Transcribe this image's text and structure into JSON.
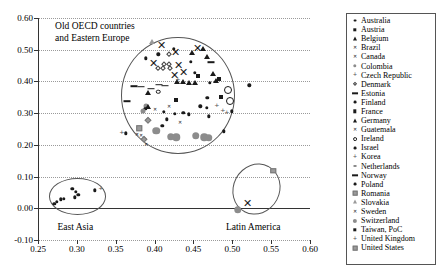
{
  "chart_data": {
    "type": "scatter",
    "title": "",
    "xlabel": "",
    "ylabel": "",
    "xlim": [
      0.25,
      0.6
    ],
    "ylim": [
      -0.1,
      0.6
    ],
    "grid": true,
    "legend_position": "right",
    "xticks": [
      "0.25",
      "0.30",
      "0.35",
      "0.40",
      "0.45",
      "0.50",
      "0.55",
      "0.60"
    ],
    "xtick_values": [
      0.25,
      0.3,
      0.35,
      0.4,
      0.45,
      0.5,
      0.55,
      0.6
    ],
    "yticks": [
      "-0.10",
      "0.00",
      "0.10",
      "0.20",
      "0.30",
      "0.40",
      "0.50",
      "0.60"
    ],
    "ytick_values": [
      -0.1,
      0.0,
      0.1,
      0.2,
      0.3,
      0.4,
      0.5,
      0.6
    ],
    "annotations": [
      {
        "text": "Old OECD countries\nand Eastern Europe",
        "x": 0.272,
        "y": 0.575
      },
      {
        "text": "East Asia",
        "x": 0.298,
        "y": -0.062
      },
      {
        "text": "Latin America",
        "x": 0.527,
        "y": -0.062
      }
    ],
    "cluster_ellipses": [
      {
        "name": "old-oecd-eastern-europe",
        "cx": 0.43,
        "cy": 0.355,
        "rx": 0.073,
        "ry": 0.185,
        "rotation": 0
      },
      {
        "name": "east-asia",
        "cx": 0.301,
        "cy": 0.038,
        "rx": 0.037,
        "ry": 0.058,
        "rotation": 0
      },
      {
        "name": "latin-america",
        "cx": 0.531,
        "cy": 0.06,
        "rx": 0.03,
        "ry": 0.082,
        "rotation": 28
      }
    ],
    "legend_entries": [
      {
        "label": "Australia",
        "marker": "dot"
      },
      {
        "label": "Austria",
        "marker": "square"
      },
      {
        "label": "Belgium",
        "marker": "triangle"
      },
      {
        "label": "Brazil",
        "marker": "x"
      },
      {
        "label": "Canada",
        "marker": "x"
      },
      {
        "label": "Colombia",
        "marker": "circle-gray"
      },
      {
        "label": "Czech Republic",
        "marker": "plus"
      },
      {
        "label": "Denmark",
        "marker": "diamond-open"
      },
      {
        "label": "Estonia",
        "marker": "dash"
      },
      {
        "label": "Finland",
        "marker": "dot"
      },
      {
        "label": "France",
        "marker": "square"
      },
      {
        "label": "Germany",
        "marker": "triangle"
      },
      {
        "label": "Guatemala",
        "marker": "x"
      },
      {
        "label": "Ireland",
        "marker": "circle-open"
      },
      {
        "label": "Israel",
        "marker": "dot"
      },
      {
        "label": "Korea",
        "marker": "plus"
      },
      {
        "label": "Netherlands",
        "marker": "dash-small"
      },
      {
        "label": "Norway",
        "marker": "dash"
      },
      {
        "label": "Poland",
        "marker": "dot"
      },
      {
        "label": "Romania",
        "marker": "square-gray"
      },
      {
        "label": "Slovakia",
        "marker": "triangle-gray"
      },
      {
        "label": "Sweden",
        "marker": "x"
      },
      {
        "label": "Switzerland",
        "marker": "dot-gray"
      },
      {
        "label": "Taiwan, PoC",
        "marker": "square"
      },
      {
        "label": "United Kingdom",
        "marker": "plus"
      },
      {
        "label": "United States",
        "marker": "square-gray"
      }
    ],
    "points": [
      {
        "x": 0.397,
        "y": 0.523,
        "marker": "triangle-gray"
      },
      {
        "x": 0.409,
        "y": 0.515,
        "marker": "x-big"
      },
      {
        "x": 0.425,
        "y": 0.503,
        "marker": "dot"
      },
      {
        "x": 0.455,
        "y": 0.505,
        "marker": "x-big"
      },
      {
        "x": 0.462,
        "y": 0.501,
        "marker": "triangle"
      },
      {
        "x": 0.405,
        "y": 0.486,
        "marker": "dot"
      },
      {
        "x": 0.418,
        "y": 0.487,
        "marker": "diamond-open"
      },
      {
        "x": 0.427,
        "y": 0.492,
        "marker": "x-big"
      },
      {
        "x": 0.448,
        "y": 0.489,
        "marker": "triangle"
      },
      {
        "x": 0.389,
        "y": 0.473,
        "marker": "dot"
      },
      {
        "x": 0.468,
        "y": 0.477,
        "marker": "triangle"
      },
      {
        "x": 0.398,
        "y": 0.457,
        "marker": "x-big"
      },
      {
        "x": 0.412,
        "y": 0.456,
        "marker": "diamond-open"
      },
      {
        "x": 0.419,
        "y": 0.456,
        "marker": "diamond-open"
      },
      {
        "x": 0.431,
        "y": 0.452,
        "marker": "x-big"
      },
      {
        "x": 0.447,
        "y": 0.461,
        "marker": "dot"
      },
      {
        "x": 0.473,
        "y": 0.46,
        "marker": "dash"
      },
      {
        "x": 0.404,
        "y": 0.443,
        "marker": "diamond-open"
      },
      {
        "x": 0.411,
        "y": 0.442,
        "marker": "diamond-open"
      },
      {
        "x": 0.42,
        "y": 0.443,
        "marker": "diamond-open"
      },
      {
        "x": 0.437,
        "y": 0.43,
        "marker": "x-big"
      },
      {
        "x": 0.452,
        "y": 0.428,
        "marker": "dot"
      },
      {
        "x": 0.475,
        "y": 0.424,
        "marker": "triangle"
      },
      {
        "x": 0.456,
        "y": 0.418,
        "marker": "square"
      },
      {
        "x": 0.425,
        "y": 0.421,
        "marker": "x-big"
      },
      {
        "x": 0.483,
        "y": 0.407,
        "marker": "square"
      },
      {
        "x": 0.479,
        "y": 0.401,
        "marker": "triangle"
      },
      {
        "x": 0.429,
        "y": 0.399,
        "marker": "triangle"
      },
      {
        "x": 0.436,
        "y": 0.398,
        "marker": "triangle"
      },
      {
        "x": 0.444,
        "y": 0.396,
        "marker": "triangle"
      },
      {
        "x": 0.452,
        "y": 0.395,
        "marker": "triangle"
      },
      {
        "x": 0.43,
        "y": 0.404,
        "marker": "plus"
      },
      {
        "x": 0.471,
        "y": 0.395,
        "marker": "dot"
      },
      {
        "x": 0.373,
        "y": 0.385,
        "marker": "dash"
      },
      {
        "x": 0.382,
        "y": 0.383,
        "marker": "dash"
      },
      {
        "x": 0.406,
        "y": 0.39,
        "marker": "dash"
      },
      {
        "x": 0.414,
        "y": 0.387,
        "marker": "dash"
      },
      {
        "x": 0.395,
        "y": 0.377,
        "marker": "dash"
      },
      {
        "x": 0.391,
        "y": 0.364,
        "marker": "triangle"
      },
      {
        "x": 0.405,
        "y": 0.367,
        "marker": "circle-open"
      },
      {
        "x": 0.495,
        "y": 0.373,
        "marker": "circle-open-big"
      },
      {
        "x": 0.522,
        "y": 0.388,
        "marker": "dot"
      },
      {
        "x": 0.364,
        "y": 0.338,
        "marker": "dash"
      },
      {
        "x": 0.427,
        "y": 0.34,
        "marker": "square"
      },
      {
        "x": 0.497,
        "y": 0.338,
        "marker": "circle-open-big"
      },
      {
        "x": 0.485,
        "y": 0.352,
        "marker": "square"
      },
      {
        "x": 0.468,
        "y": 0.348,
        "marker": "dot"
      },
      {
        "x": 0.389,
        "y": 0.322,
        "marker": "dot-gray"
      },
      {
        "x": 0.392,
        "y": 0.32,
        "marker": "triangle"
      },
      {
        "x": 0.388,
        "y": 0.313,
        "marker": "dot"
      },
      {
        "x": 0.385,
        "y": 0.306,
        "marker": "dot-gray"
      },
      {
        "x": 0.4,
        "y": 0.312,
        "marker": "x-small"
      },
      {
        "x": 0.419,
        "y": 0.323,
        "marker": "x-small"
      },
      {
        "x": 0.412,
        "y": 0.305,
        "marker": "dot"
      },
      {
        "x": 0.459,
        "y": 0.321,
        "marker": "dot"
      },
      {
        "x": 0.467,
        "y": 0.317,
        "marker": "dot"
      },
      {
        "x": 0.48,
        "y": 0.322,
        "marker": "plus"
      },
      {
        "x": 0.488,
        "y": 0.308,
        "marker": "plus"
      },
      {
        "x": 0.493,
        "y": 0.302,
        "marker": "plus"
      },
      {
        "x": 0.499,
        "y": 0.306,
        "marker": "dot"
      },
      {
        "x": 0.426,
        "y": 0.298,
        "marker": "dot"
      },
      {
        "x": 0.437,
        "y": 0.301,
        "marker": "dot"
      },
      {
        "x": 0.444,
        "y": 0.296,
        "marker": "dot"
      },
      {
        "x": 0.47,
        "y": 0.29,
        "marker": "dot"
      },
      {
        "x": 0.391,
        "y": 0.277,
        "marker": "diamond-g"
      },
      {
        "x": 0.416,
        "y": 0.28,
        "marker": "dot"
      },
      {
        "x": 0.433,
        "y": 0.271,
        "marker": "x-small"
      },
      {
        "x": 0.41,
        "y": 0.261,
        "marker": "dot"
      },
      {
        "x": 0.38,
        "y": 0.253,
        "marker": "square-gray"
      },
      {
        "x": 0.402,
        "y": 0.245,
        "marker": "dot-gray-big"
      },
      {
        "x": 0.358,
        "y": 0.237,
        "marker": "plus"
      },
      {
        "x": 0.363,
        "y": 0.236,
        "marker": "dot"
      },
      {
        "x": 0.377,
        "y": 0.234,
        "marker": "x-small"
      },
      {
        "x": 0.383,
        "y": 0.23,
        "marker": "x-small"
      },
      {
        "x": 0.386,
        "y": 0.22,
        "marker": "diamond-g"
      },
      {
        "x": 0.421,
        "y": 0.226,
        "marker": "dot-gray-big"
      },
      {
        "x": 0.428,
        "y": 0.224,
        "marker": "dot-gray-big"
      },
      {
        "x": 0.453,
        "y": 0.228,
        "marker": "dot-gray-big"
      },
      {
        "x": 0.464,
        "y": 0.224,
        "marker": "dot-gray-big"
      },
      {
        "x": 0.47,
        "y": 0.222,
        "marker": "dot-gray-big"
      },
      {
        "x": 0.489,
        "y": 0.243,
        "marker": "dot"
      },
      {
        "x": 0.389,
        "y": 0.202,
        "marker": "x-small"
      },
      {
        "x": 0.271,
        "y": 0.015,
        "marker": "dot"
      },
      {
        "x": 0.274,
        "y": 0.02,
        "marker": "dot"
      },
      {
        "x": 0.279,
        "y": 0.028,
        "marker": "dot"
      },
      {
        "x": 0.283,
        "y": 0.03,
        "marker": "dot"
      },
      {
        "x": 0.294,
        "y": 0.062,
        "marker": "dot"
      },
      {
        "x": 0.299,
        "y": 0.052,
        "marker": "dot"
      },
      {
        "x": 0.297,
        "y": 0.035,
        "marker": "dot"
      },
      {
        "x": 0.302,
        "y": 0.042,
        "marker": "dot"
      },
      {
        "x": 0.323,
        "y": 0.057,
        "marker": "dot"
      },
      {
        "x": 0.331,
        "y": 0.06,
        "marker": "plus"
      },
      {
        "x": 0.553,
        "y": 0.119,
        "marker": "square-gray"
      },
      {
        "x": 0.52,
        "y": 0.018,
        "marker": "x-big"
      },
      {
        "x": 0.507,
        "y": -0.005,
        "marker": "dot-gray-big"
      }
    ]
  }
}
